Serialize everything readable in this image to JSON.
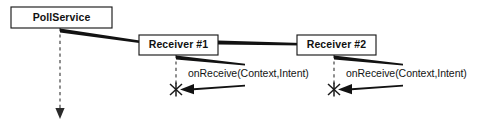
{
  "diagram": {
    "type": "uml-sequence-diagram",
    "title": "",
    "canvas": {
      "width": 481,
      "height": 126
    },
    "colors": {
      "background": "#ffffff",
      "stroke": "#1a1a1a",
      "text": "#111111",
      "lifeline": "#333333"
    },
    "participants": [
      {
        "id": "pollservice",
        "label": "PollService",
        "box": {
          "x": 11,
          "y": 7,
          "width": 101,
          "height": 21
        },
        "lifeline": {
          "x": 60,
          "y1": 28,
          "y2": 113
        },
        "has_terminal_arrow": true,
        "termination": "none"
      },
      {
        "id": "receiver1",
        "label": "Receiver #1",
        "box": {
          "x": 139,
          "y": 35,
          "width": 79,
          "height": 20
        },
        "lifeline": {
          "x": 176,
          "y1": 55,
          "y2": 88
        },
        "has_terminal_arrow": false,
        "termination": "x-marker"
      },
      {
        "id": "receiver2",
        "label": "Receiver #2",
        "box": {
          "x": 297,
          "y": 35,
          "width": 79,
          "height": 20
        },
        "lifeline": {
          "x": 334,
          "y1": 55,
          "y2": 88
        },
        "has_terminal_arrow": false,
        "termination": "x-marker"
      }
    ],
    "messages": [
      {
        "id": "msg-pollservice-to-receiver1",
        "label": "",
        "from": "pollservice",
        "to": "receiver1",
        "style": "tapered-wedge",
        "direction": "right"
      },
      {
        "id": "msg-receiver1-to-receiver2",
        "label": "",
        "from": "receiver1",
        "to": "receiver2",
        "style": "tapered-wedge",
        "direction": "right"
      },
      {
        "id": "msg-receiver1-self-onreceive",
        "label": "onReceive(Context,Intent)",
        "from": "receiver1",
        "to": "receiver1",
        "style": "self-call-tapered-wedge",
        "direction": "self",
        "label_position": {
          "x": 188,
          "y": 73
        }
      },
      {
        "id": "msg-receiver2-self-onreceive",
        "label": "onReceive(Context,Intent)",
        "from": "receiver2",
        "to": "receiver2",
        "style": "self-call-tapered-wedge",
        "direction": "self",
        "label_position": {
          "x": 346,
          "y": 73
        }
      }
    ]
  }
}
